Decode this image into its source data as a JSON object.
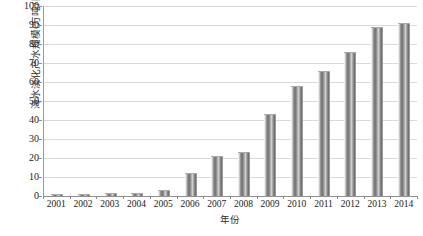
{
  "chart_data": {
    "type": "bar",
    "title": "",
    "xlabel": "年份",
    "ylabel": "海水淡化产水规模(万吨/日)",
    "categories": [
      "2001",
      "2002",
      "2003",
      "2004",
      "2005",
      "2006",
      "2007",
      "2008",
      "2009",
      "2010",
      "2011",
      "2012",
      "2013",
      "2014"
    ],
    "values": [
      1,
      1.2,
      1.5,
      1.7,
      3,
      12,
      21,
      23,
      43,
      58,
      66,
      76,
      89,
      91
    ],
    "series": [
      {
        "name": "海水淡化产水规模",
        "values": [
          1,
          1.2,
          1.5,
          1.7,
          3,
          12,
          21,
          23,
          43,
          58,
          66,
          76,
          89,
          91
        ]
      }
    ],
    "ylim": [
      0,
      100
    ],
    "y_ticks": [
      0,
      10,
      20,
      30,
      40,
      50,
      60,
      70,
      80,
      90,
      100
    ],
    "y_tick_labels": [
      "0",
      "10",
      "20",
      "30",
      "40",
      "50",
      "60",
      "70",
      "80",
      "90",
      "100"
    ],
    "grid": true,
    "legend": false,
    "legend_position": "none",
    "bar_color": "#8a8a8a",
    "gridline_color": "#d9d9d9",
    "axis_color": "#8f8f8f",
    "text_color": "#222222"
  }
}
